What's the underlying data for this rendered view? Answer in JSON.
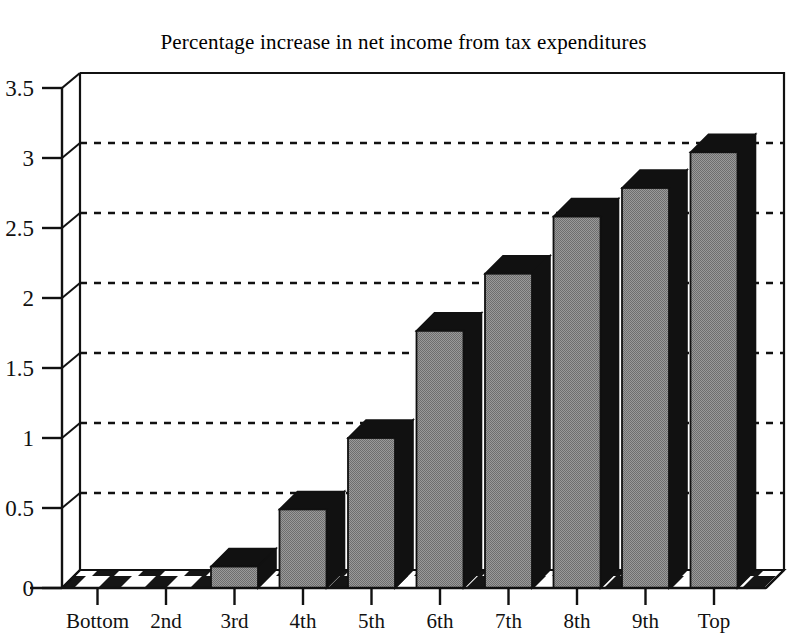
{
  "chart_data": {
    "type": "bar",
    "title": "Percentage increase in net income from tax expenditures",
    "xlabel": "",
    "ylabel": "",
    "categories": [
      "Bottom",
      "2nd",
      "3rd",
      "4th",
      "5th",
      "6th",
      "7th",
      "8th",
      "9th",
      "Top"
    ],
    "values": [
      0.0,
      0.0,
      0.15,
      0.55,
      1.05,
      1.8,
      2.2,
      2.6,
      2.8,
      3.05
    ],
    "ylim": [
      0,
      3.5
    ],
    "ytick_labels": [
      "0",
      "0.5",
      "1",
      "1.5",
      "2",
      "2.5",
      "3",
      "3.5"
    ],
    "ytick_values": [
      0,
      0.5,
      1,
      1.5,
      2,
      2.5,
      3,
      3.5
    ],
    "grid": true,
    "grid_style": "dotted",
    "legend": null,
    "style": "3d-bars",
    "colors": {
      "bar_front": "#8c8c8c",
      "bar_side": "#111111",
      "bar_top": "#111111",
      "axis": "#111111",
      "grid": "#111111",
      "background": "#ffffff"
    }
  },
  "axes": {
    "y_axis_name": "y-axis",
    "x_axis_name": "x-axis"
  }
}
